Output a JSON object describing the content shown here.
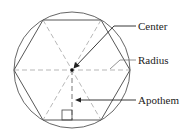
{
  "diagram": {
    "labels": {
      "center": "Center",
      "radius": "Radius",
      "apothem": "Apothem"
    },
    "colors": {
      "stroke": "#333333",
      "dashed": "#999999",
      "text": "#222222",
      "background": "#ffffff"
    }
  }
}
